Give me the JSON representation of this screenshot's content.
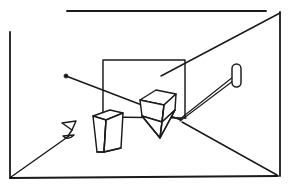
{
  "scene": {
    "title": "Line-art perspective sketch of a room interior",
    "description": "Hand-drawn monochrome wireframe drawing showing a rectangular room enclosure in perspective, a rectangular panel on the back wall, two faceted polyhedral objects on a ledge, a small goblet shape at left, a rounded paddle shape at right, and straight sight-lines radiating between them.",
    "background_color": "#ffffff",
    "ink_color": "#1a1a1a",
    "width": 288,
    "height": 185
  },
  "geometry": {
    "room_frame": {
      "label": "room-enclosure",
      "top_edge": {
        "x1": 67,
        "y1": 11,
        "x2": 266,
        "y2": 11
      },
      "left_edge": {
        "x1": 10,
        "y1": 32,
        "x2": 10,
        "y2": 178
      },
      "right_edge": {
        "x1": 280,
        "y1": 12,
        "x2": 280,
        "y2": 176
      },
      "bottom_edge": {
        "x1": 10,
        "y1": 178,
        "x2": 278,
        "y2": 176
      }
    },
    "back_panel": {
      "label": "wall-panel",
      "x": 103,
      "y": 60,
      "width": 82,
      "height": 58
    },
    "ledge_line": {
      "x1": 104,
      "y1": 117,
      "x2": 186,
      "y2": 118
    },
    "sight_lines": [
      {
        "name": "ray-from-node-to-pyramid",
        "x1": 66,
        "y1": 76,
        "x2": 181,
        "y2": 120
      },
      {
        "name": "ray-corner-topright-to-panel",
        "x1": 280,
        "y1": 13,
        "x2": 161,
        "y2": 76
      },
      {
        "name": "ray-pyramid-to-paddle-upper",
        "x1": 180,
        "y1": 119,
        "x2": 233,
        "y2": 77
      },
      {
        "name": "ray-pyramid-to-paddle-lower",
        "x1": 180,
        "y1": 121,
        "x2": 233,
        "y2": 81
      },
      {
        "name": "ray-pyramid-to-bottom-right-corner",
        "x1": 182,
        "y1": 122,
        "x2": 277,
        "y2": 175
      },
      {
        "name": "ray-goblet-to-bottom-left-corner",
        "x1": 11,
        "y1": 177,
        "x2": 69,
        "y2": 136
      }
    ],
    "node_dot": {
      "cx": 66,
      "cy": 76,
      "r": 2.1
    },
    "paddle": {
      "x": 232,
      "y": 64,
      "width": 9,
      "height": 23,
      "radius": 4.5
    }
  },
  "objects": [
    {
      "id": "obj-prism-left",
      "label": "upright wedge prism",
      "kind": "polyhedron",
      "faces": [
        {
          "name": "top-face",
          "points": "93,116 110,110 123,113 106,120"
        },
        {
          "name": "front-face",
          "points": "93,116 106,120 104,152 97,152"
        },
        {
          "name": "right-face",
          "points": "106,120 123,113 121,148 104,152"
        }
      ],
      "edges": [
        {
          "x1": 106,
          "y1": 120,
          "x2": 104,
          "y2": 152
        },
        {
          "x1": 97,
          "y1": 152,
          "x2": 104,
          "y2": 152
        },
        {
          "x1": 104,
          "y1": 152,
          "x2": 121,
          "y2": 148
        }
      ]
    },
    {
      "id": "obj-pyramid-right",
      "label": "inverted faceted pyramid with cap",
      "kind": "polyhedron",
      "faces": [
        {
          "name": "cap-top",
          "points": "140,100 156,90 176,94 164,105"
        },
        {
          "name": "cap-left",
          "points": "140,100 164,105 162,122 142,116"
        },
        {
          "name": "cap-right",
          "points": "164,105 176,94 175,110 162,122"
        },
        {
          "name": "apex-left",
          "points": "142,116 162,122 160,138"
        },
        {
          "name": "apex-right",
          "points": "162,122 175,110 160,138"
        }
      ],
      "edges": [
        {
          "x1": 164,
          "y1": 105,
          "x2": 162,
          "y2": 122
        },
        {
          "x1": 162,
          "y1": 122,
          "x2": 160,
          "y2": 138
        },
        {
          "x1": 142,
          "y1": 116,
          "x2": 160,
          "y2": 138
        },
        {
          "x1": 175,
          "y1": 110,
          "x2": 160,
          "y2": 138
        }
      ]
    },
    {
      "id": "obj-goblet-left",
      "label": "small goblet",
      "kind": "outline",
      "strokes": [
        {
          "name": "bowl-rim",
          "d": "M 62 123 L 76 121"
        },
        {
          "name": "bowl-left",
          "d": "M 62 123 L 72 130"
        },
        {
          "name": "bowl-right",
          "d": "M 76 121 L 72 130"
        },
        {
          "name": "stem",
          "d": "M 72 130 L 68 136"
        },
        {
          "name": "base-left",
          "d": "M 63 136 L 74 135"
        },
        {
          "name": "base-arc",
          "d": "M 63 136 Q 68 141 74 135"
        }
      ]
    }
  ],
  "legend": {
    "node_label": "light-source-node",
    "panel_label": "wall-panel",
    "paddle_label": "paddle-mirror"
  }
}
